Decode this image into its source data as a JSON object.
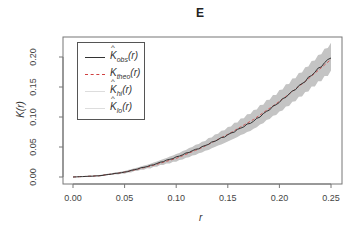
{
  "chart_data": {
    "type": "line",
    "title": "E",
    "xlabel": "r",
    "ylabel": "K(r)",
    "xlim": [
      0,
      0.25
    ],
    "ylim": [
      0,
      0.22
    ],
    "x_ticks": [
      "0.00",
      "0.05",
      "0.10",
      "0.15",
      "0.20",
      "0.25"
    ],
    "y_ticks": [
      "0.00",
      "0.05",
      "0.10",
      "0.15",
      "0.20"
    ],
    "grid": false,
    "legend_position": "top-left",
    "x": [
      0.0,
      0.025,
      0.05,
      0.075,
      0.1,
      0.125,
      0.15,
      0.175,
      0.2,
      0.225,
      0.25
    ],
    "series": [
      {
        "name": "K_obs(r)",
        "label_main": "K",
        "label_sub": "obs",
        "hat": true,
        "style": "solid",
        "color": "#333333",
        "values": [
          0.0,
          0.002,
          0.008,
          0.019,
          0.033,
          0.05,
          0.07,
          0.093,
          0.125,
          0.16,
          0.2
        ]
      },
      {
        "name": "K_theo(r)",
        "label_main": "K",
        "label_sub": "theo",
        "hat": false,
        "style": "dashed",
        "color": "#d04040",
        "values": [
          0.0,
          0.002,
          0.008,
          0.018,
          0.031,
          0.049,
          0.071,
          0.096,
          0.126,
          0.159,
          0.196
        ]
      },
      {
        "name": "K_hi(r)",
        "label_main": "K",
        "label_sub": "hi",
        "hat": true,
        "style": "envelope",
        "color": "#bbbbbb",
        "values": [
          0.0,
          0.003,
          0.01,
          0.022,
          0.038,
          0.058,
          0.082,
          0.11,
          0.143,
          0.181,
          0.222
        ]
      },
      {
        "name": "K_lo(r)",
        "label_main": "K",
        "label_sub": "lo",
        "hat": true,
        "style": "envelope",
        "color": "#bbbbbb",
        "values": [
          0.0,
          0.001,
          0.006,
          0.015,
          0.026,
          0.041,
          0.059,
          0.08,
          0.108,
          0.14,
          0.175
        ]
      }
    ]
  }
}
